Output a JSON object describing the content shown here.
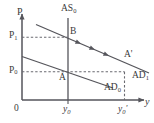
{
  "figure": {
    "type": "economics-ad-as-diagram",
    "axes": {
      "y_axis_label": "P",
      "x_axis_label": "y",
      "origin_label": "0"
    },
    "price_ticks": [
      {
        "id": "p1",
        "base": "P",
        "sub": "1"
      },
      {
        "id": "p0",
        "base": "P",
        "sub": "0"
      }
    ],
    "output_ticks": [
      {
        "id": "y0",
        "base": "y",
        "sub": "0",
        "prime": ""
      },
      {
        "id": "y0prime",
        "base": "y",
        "sub": "0",
        "prime": "'"
      }
    ],
    "curves": [
      {
        "id": "as0",
        "base": "AS",
        "sub": "0",
        "prime": ""
      },
      {
        "id": "ad0",
        "base": "AD",
        "sub": "0",
        "prime": ""
      },
      {
        "id": "ad1",
        "base": "AD",
        "sub": "1",
        "prime": ""
      }
    ],
    "points": [
      {
        "id": "a",
        "label": "A"
      },
      {
        "id": "b",
        "label": "B"
      },
      {
        "id": "aprime",
        "label": "A'"
      }
    ],
    "colors": {
      "line": "#55555b",
      "dashed": "#6a6a70",
      "text": "#3a3a3a",
      "background": "#ffffff"
    }
  }
}
